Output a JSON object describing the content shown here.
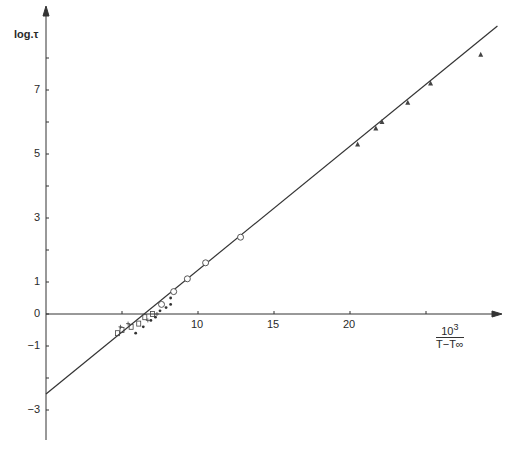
{
  "chart_data": {
    "type": "scatter",
    "title": "",
    "xlabel": "10^3 / (T − T∞)",
    "xlabel_num": "10",
    "xlabel_exp": "3",
    "xlabel_den": "T−T∞",
    "ylabel": "log.τ",
    "xlim": [
      0,
      30
    ],
    "ylim": [
      -4,
      9.5
    ],
    "grid": false,
    "legend": null,
    "x_ticks": [
      5,
      10,
      15,
      20,
      25
    ],
    "x_tick_labels": [
      "",
      "10",
      "15",
      "20",
      ""
    ],
    "y_ticks": [
      -3,
      -2,
      -1,
      0,
      1,
      2,
      3,
      4,
      5,
      6,
      7,
      8
    ],
    "y_tick_labels": [
      "−3",
      "",
      "−1",
      "0",
      "1",
      "",
      "3",
      "",
      "5",
      "",
      "7",
      ""
    ],
    "fit_line": {
      "x": [
        0,
        29.7
      ],
      "y": [
        -2.5,
        9.0
      ]
    },
    "series": [
      {
        "name": "triangles",
        "marker": "triangle",
        "points": [
          [
            20.5,
            5.3
          ],
          [
            21.7,
            5.8
          ],
          [
            22.1,
            6.0
          ],
          [
            23.8,
            6.6
          ],
          [
            25.3,
            7.2
          ],
          [
            28.6,
            8.1
          ]
        ]
      },
      {
        "name": "circles",
        "marker": "circle",
        "points": [
          [
            7.6,
            0.3
          ],
          [
            8.4,
            0.7
          ],
          [
            9.3,
            1.1
          ],
          [
            10.5,
            1.6
          ],
          [
            12.8,
            2.4
          ]
        ]
      },
      {
        "name": "squares",
        "marker": "square",
        "points": [
          [
            4.7,
            -0.6
          ],
          [
            5.0,
            -0.5
          ],
          [
            5.6,
            -0.4
          ],
          [
            6.1,
            -0.3
          ],
          [
            6.5,
            -0.1
          ],
          [
            7.0,
            0.0
          ]
        ]
      },
      {
        "name": "dots",
        "marker": "dot",
        "points": [
          [
            5.9,
            -0.6
          ],
          [
            6.4,
            -0.4
          ],
          [
            6.9,
            -0.2
          ],
          [
            7.2,
            -0.1
          ],
          [
            7.5,
            0.1
          ],
          [
            7.9,
            0.2
          ],
          [
            8.2,
            0.3
          ],
          [
            8.2,
            0.5
          ]
        ]
      },
      {
        "name": "crosses",
        "marker": "cross",
        "points": [
          [
            4.9,
            -0.4
          ],
          [
            5.4,
            -0.3
          ],
          [
            6.7,
            -0.2
          ],
          [
            7.3,
            0.0
          ]
        ]
      }
    ]
  },
  "axes": {
    "origin_px": [
      46,
      314
    ],
    "x_px_per_unit": 15.2,
    "y_px_per_unit": 32
  }
}
